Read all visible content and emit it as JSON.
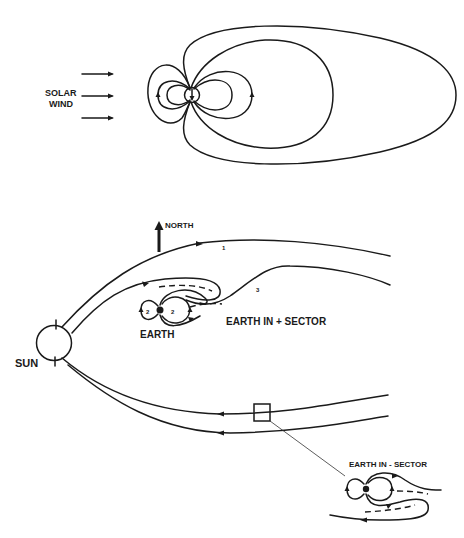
{
  "diagram": {
    "top_panel": {
      "solar_wind_label_line1": "SOLAR",
      "solar_wind_label_line2": "WIND"
    },
    "bottom_panel": {
      "north_label": "NORTH",
      "sun_label": "SUN",
      "earth_label": "EARTH",
      "plus_sector_label": "EARTH  IN + SECTOR",
      "minus_sector_label": "EARTH  IN - SECTOR",
      "field_line_labels": [
        "1",
        "2",
        "2",
        "3"
      ]
    },
    "colors": {
      "line": "#1a1a1a",
      "background": "#ffffff"
    }
  }
}
